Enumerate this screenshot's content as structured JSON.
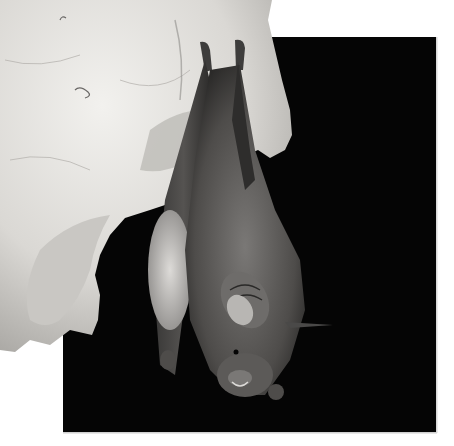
{
  "image": {
    "subject": "Bat hanging upside down from a limestone cave rock",
    "colors": {
      "background": "#ffffff",
      "night_panel": "#050505",
      "rock_light": "#e8e6e2",
      "rock_shadow": "#9a9894",
      "bat_fur": "#5a5856",
      "bat_wing": "#2e2d2c",
      "bat_belly": "#c9c7c4"
    }
  }
}
